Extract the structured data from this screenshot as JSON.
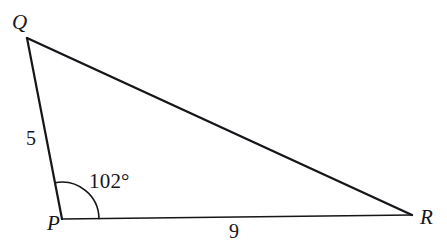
{
  "figure": {
    "type": "triangle-diagram",
    "background_color": "#ffffff",
    "stroke_color": "#16161a"
  },
  "vertices": [
    {
      "id": "Q",
      "label": "Q",
      "x": 27,
      "y": 38
    },
    {
      "id": "P",
      "label": "P",
      "x": 62,
      "y": 219
    },
    {
      "id": "R",
      "label": "R",
      "x": 412,
      "y": 215
    }
  ],
  "sides": [
    {
      "id": "PQ",
      "label": "5",
      "from": "P",
      "to": "Q",
      "stroke_width": 2.2
    },
    {
      "id": "QR",
      "label": "",
      "from": "Q",
      "to": "R",
      "stroke_width": 2.4
    },
    {
      "id": "PR",
      "label": "9",
      "from": "P",
      "to": "R",
      "stroke_width": 1.7
    }
  ],
  "angles": [
    {
      "id": "angle-P",
      "at": "P",
      "label": "102°",
      "value": 102,
      "unit": "degrees",
      "arc_radius": 37,
      "stroke_width": 1.6
    }
  ],
  "labels": {
    "vertex_q": "Q",
    "vertex_p": "P",
    "vertex_r": "R",
    "side_pq": "5",
    "side_pr": "9",
    "angle_p": "102°"
  }
}
